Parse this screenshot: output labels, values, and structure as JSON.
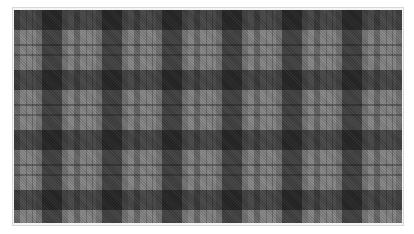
{
  "image": {
    "subject": "grayscale plaid fabric swatch",
    "colors": {
      "background": "#ffffff",
      "frame_border": "#d8d8d8",
      "base_gray": "#858585",
      "dark_check": "#1a1a1a",
      "mid_band": "#555555"
    },
    "pattern": {
      "repeat_px": 60,
      "vertical_dark_bands": 6,
      "horizontal_dark_bands": 4
    }
  }
}
